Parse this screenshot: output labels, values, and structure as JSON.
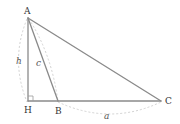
{
  "diagram": {
    "type": "geometry-triangle",
    "vertices": [
      {
        "id": "A",
        "label": "A",
        "x": 28,
        "y": 18
      },
      {
        "id": "H",
        "label": "H",
        "x": 28,
        "y": 101
      },
      {
        "id": "B",
        "label": "B",
        "x": 58,
        "y": 101
      },
      {
        "id": "C",
        "label": "C",
        "x": 161,
        "y": 101
      }
    ],
    "segments": [
      {
        "from": "A",
        "to": "H",
        "name": "altitude"
      },
      {
        "from": "A",
        "to": "B",
        "name": "side-c"
      },
      {
        "from": "A",
        "to": "C",
        "name": "side-b"
      },
      {
        "from": "H",
        "to": "C",
        "name": "base-line"
      }
    ],
    "measures": {
      "h": "h",
      "c": "c",
      "a": "a"
    },
    "right_angle_at": "H",
    "colors": {
      "edge": "#8a8a8a",
      "dimension": "#d2d2d2",
      "label": "#333333"
    }
  }
}
